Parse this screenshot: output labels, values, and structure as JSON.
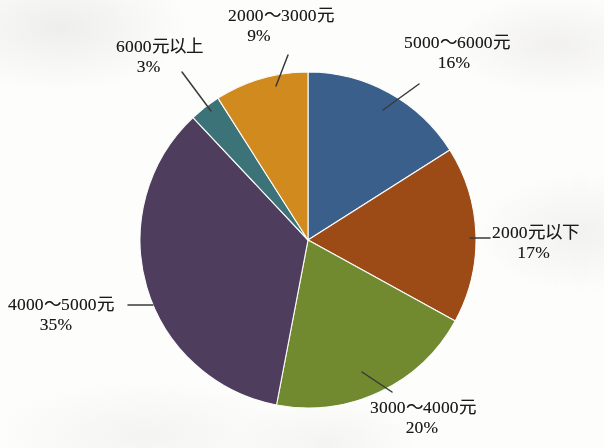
{
  "chart_data": {
    "type": "pie",
    "title": "",
    "subtitle": "",
    "xlabel": "",
    "ylabel": "",
    "legend_position": "none",
    "grid": false,
    "unit": "%",
    "start_angle_deg": 0,
    "direction": "clockwise",
    "center": {
      "x": 308,
      "y": 240
    },
    "radius": 168,
    "categories": [
      "5000～6000元",
      "2000元以下",
      "3000～4000元",
      "4000～5000元",
      "6000元以上",
      "2000～3000元"
    ],
    "values": [
      16,
      17,
      20,
      35,
      3,
      9
    ],
    "colors": [
      "#3a5f8a",
      "#9c4a16",
      "#71892f",
      "#4f3d5e",
      "#3c7379",
      "#d08a1e"
    ],
    "slices": [
      {
        "id": "slice-5000-6000",
        "label": "5000～6000元",
        "value": 16,
        "value_text": "16%",
        "color": "#3a5f8a",
        "color_name": "steel-blue",
        "start_deg": 0,
        "end_deg": 57.6
      },
      {
        "id": "slice-2000-under",
        "label": "2000元以下",
        "value": 17,
        "value_text": "17%",
        "color": "#9c4a16",
        "color_name": "rust-brown",
        "start_deg": 57.6,
        "end_deg": 118.8
      },
      {
        "id": "slice-3000-4000",
        "label": "3000～4000元",
        "value": 20,
        "value_text": "20%",
        "color": "#71892f",
        "color_name": "olive-green",
        "start_deg": 118.8,
        "end_deg": 190.8
      },
      {
        "id": "slice-4000-5000",
        "label": "4000～5000元",
        "value": 35,
        "value_text": "35%",
        "color": "#4f3d5e",
        "color_name": "dark-purple",
        "start_deg": 190.8,
        "end_deg": 316.8
      },
      {
        "id": "slice-6000-up",
        "label": "6000元以上",
        "value": 3,
        "value_text": "3%",
        "color": "#3c7379",
        "color_name": "teal",
        "start_deg": 316.8,
        "end_deg": 327.6
      },
      {
        "id": "slice-2000-3000",
        "label": "2000～3000元",
        "value": 9,
        "value_text": "9%",
        "color": "#d08a1e",
        "color_name": "golden-orange",
        "start_deg": 327.6,
        "end_deg": 360
      }
    ]
  },
  "labels": {
    "l5000_6000": {
      "name": "5000～6000元",
      "pct": "16%"
    },
    "l2000_under": {
      "name": "2000元以下",
      "pct": "17%"
    },
    "l3000_4000": {
      "name": "3000～4000元",
      "pct": "20%"
    },
    "l4000_5000": {
      "name": "4000～5000元",
      "pct": "35%"
    },
    "l6000_up": {
      "name": "6000元以上",
      "pct": "3%"
    },
    "l2000_3000": {
      "name": "2000～3000元",
      "pct": "9%"
    }
  }
}
